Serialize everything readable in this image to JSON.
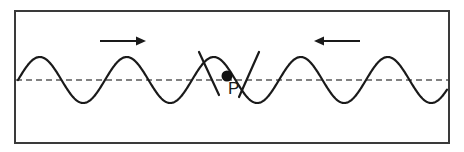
{
  "figure": {
    "background_color": "#ffffff",
    "stroke_color": "#1a1a1a",
    "dashed_line_color": "#5a5a5a",
    "border": {
      "name": "figure-border",
      "x": 14,
      "y": 10,
      "width": 436,
      "height": 134,
      "stroke_width": 2
    },
    "equilibrium_line": {
      "name": "equilibrium-dashed-line",
      "y": 80,
      "x_start": 16,
      "x_end": 448,
      "dash": "6 4",
      "stroke_width": 1.6
    },
    "wave": {
      "name": "sine-wave",
      "amplitude": 23,
      "wavelength": 87,
      "baseline_y": 80,
      "x_start": 18,
      "x_end": 447,
      "stroke_width": 2.2,
      "phase": "starts at equilibrium rising"
    },
    "arrows": [
      {
        "name": "arrow-right",
        "direction": "right",
        "x_start": 100,
        "x_end": 146,
        "y": 41,
        "label": ""
      },
      {
        "name": "arrow-left",
        "direction": "left",
        "x_start": 360,
        "x_end": 314,
        "y": 41,
        "label": ""
      }
    ],
    "point": {
      "name": "point-p",
      "label": "P",
      "dot_x": 227,
      "dot_y": 76,
      "dot_radius": 5.5,
      "label_x": 228,
      "label_y": 80
    },
    "cross_marks": [
      {
        "name": "cross-mark-left",
        "x1": 199,
        "y1": 52,
        "x2": 219,
        "y2": 95
      },
      {
        "name": "cross-mark-right",
        "x1": 259,
        "y1": 52,
        "x2": 239,
        "y2": 97
      }
    ]
  }
}
